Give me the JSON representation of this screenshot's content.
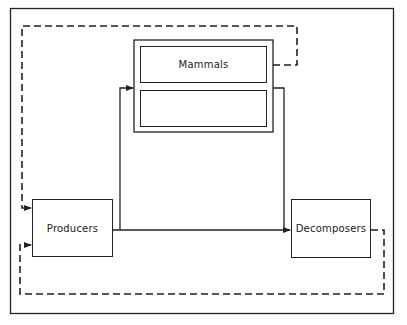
{
  "diagram": {
    "type": "flow-diagram",
    "nodes": {
      "mammals": {
        "label": "Mammals"
      },
      "mammals_lower": {
        "label": ""
      },
      "producers": {
        "label": "Producers"
      },
      "decomposers": {
        "label": "Decomposers"
      }
    },
    "edges": [
      {
        "from": "producers",
        "to": "mammals",
        "style": "solid"
      },
      {
        "from": "producers",
        "to": "decomposers",
        "style": "solid"
      },
      {
        "from": "mammals",
        "to": "decomposers",
        "style": "solid"
      },
      {
        "from": "mammals",
        "to": "producers",
        "style": "dashed"
      },
      {
        "from": "decomposers",
        "to": "producers",
        "style": "dashed"
      }
    ],
    "colors": {
      "line": "#222222",
      "background": "#ffffff"
    }
  }
}
